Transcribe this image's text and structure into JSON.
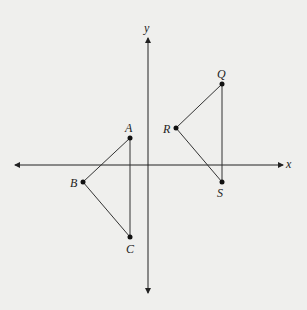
{
  "diagram": {
    "axes": {
      "x_label": "x",
      "y_label": "y"
    },
    "points": {
      "A": {
        "label": "A",
        "x": 130,
        "y": 138
      },
      "B": {
        "label": "B",
        "x": 83,
        "y": 182
      },
      "C": {
        "label": "C",
        "x": 130,
        "y": 237
      },
      "Q": {
        "label": "Q",
        "x": 222,
        "y": 84
      },
      "R": {
        "label": "R",
        "x": 176,
        "y": 128
      },
      "S": {
        "label": "S",
        "x": 222,
        "y": 182
      }
    },
    "triangles": [
      [
        "A",
        "B",
        "C"
      ],
      [
        "Q",
        "R",
        "S"
      ]
    ],
    "colors": {
      "ink": "#222222",
      "background": "#efefed"
    }
  }
}
